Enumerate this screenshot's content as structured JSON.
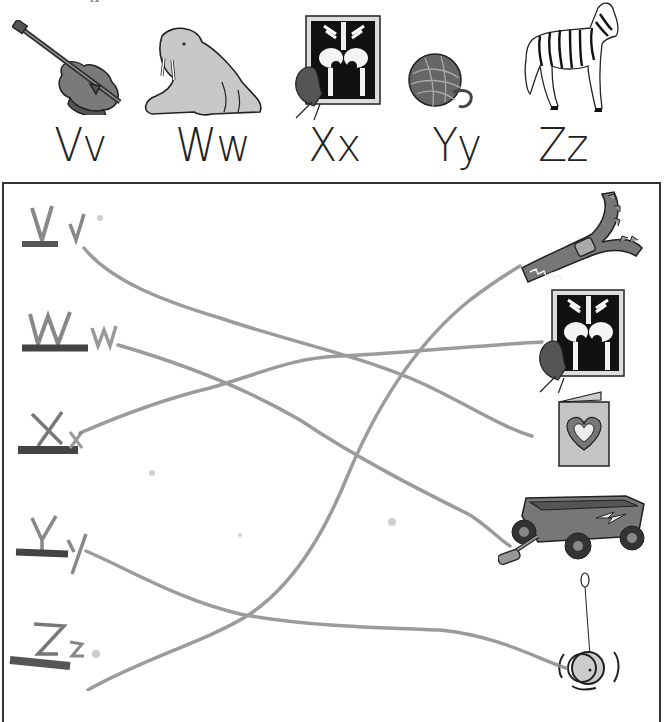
{
  "page": {
    "cutoff_text": "• ·   ·    ·    · ·     g    ·",
    "reference_row": [
      {
        "letter": "Vv",
        "picture": "violin"
      },
      {
        "letter": "Ww",
        "picture": "walrus"
      },
      {
        "letter": "Xx",
        "picture": "x-ray"
      },
      {
        "letter": "Yy",
        "picture": "yarn"
      },
      {
        "letter": "Zz",
        "picture": "zebra"
      }
    ],
    "exercise": {
      "handwritten_letters": [
        "Vv",
        "Ww",
        "Xx",
        "Yy",
        "Zz"
      ],
      "pictures": [
        "zipper",
        "x-ray",
        "valentine card",
        "wagon",
        "yo-yo"
      ],
      "matches": [
        {
          "letter": "Vv",
          "picture": "valentine card"
        },
        {
          "letter": "Ww",
          "picture": "wagon"
        },
        {
          "letter": "Xx",
          "picture": "x-ray"
        },
        {
          "letter": "Yy",
          "picture": "yo-yo"
        },
        {
          "letter": "Zz",
          "picture": "zipper"
        }
      ]
    },
    "colors": {
      "ink": "#222222",
      "pencil": "#8a8a8a",
      "border": "#333333",
      "fill_gray": "#9a9a9a"
    }
  }
}
